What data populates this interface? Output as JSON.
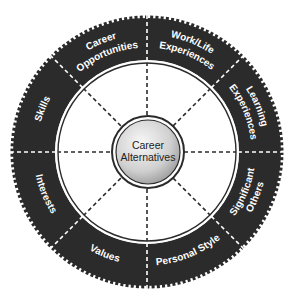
{
  "diagram": {
    "type": "career-wheel",
    "center": {
      "label_lines": [
        "Career",
        "Alternatives"
      ]
    },
    "segments": [
      {
        "id": "work-life-experiences",
        "label_lines": [
          "Work/Life",
          "Experiences"
        ]
      },
      {
        "id": "learning-experiences",
        "label_lines": [
          "Learning",
          "Experiences"
        ]
      },
      {
        "id": "significant-others",
        "label_lines": [
          "Significant",
          "Others"
        ]
      },
      {
        "id": "personal-style",
        "label_lines": [
          "Personal Style"
        ]
      },
      {
        "id": "values",
        "label_lines": [
          "Values"
        ]
      },
      {
        "id": "interests",
        "label_lines": [
          "Interests"
        ]
      },
      {
        "id": "skills",
        "label_lines": [
          "Skills"
        ]
      },
      {
        "id": "career-opportunities",
        "label_lines": [
          "Career",
          "Opportunities"
        ]
      }
    ],
    "colors": {
      "ring": "#2b2b2b",
      "ring_text": "#ffffff",
      "divider": "#2b2b2b",
      "hub_light": "#f2f2f2",
      "hub_dark": "#9a9a9a",
      "background": "#ffffff"
    }
  }
}
